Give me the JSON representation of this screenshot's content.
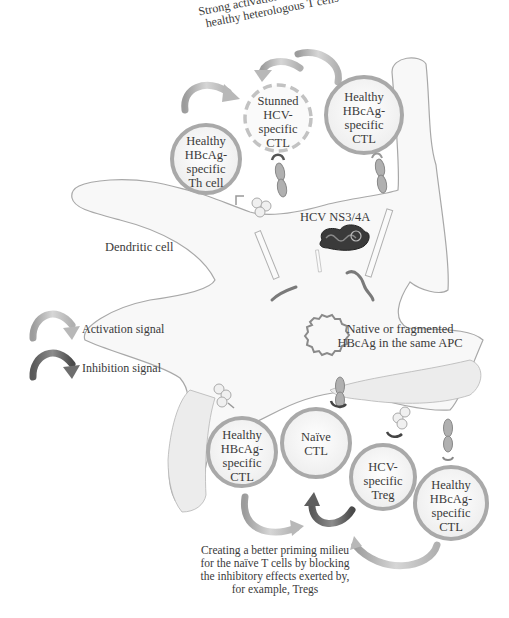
{
  "figure": {
    "top_annotation": {
      "line1": "Strong activation signals from",
      "line2": "healthy heterologous T cells"
    },
    "dendritic_cell_label": "Dendritic cell",
    "antigen_label": "HCV NS3/4A",
    "hbcag_label": {
      "line1": "Native or fragmented",
      "line2": "HBcAg in the same APC"
    },
    "legend": {
      "items": [
        {
          "label": "Activation signal",
          "color": "#b8b8b8"
        },
        {
          "label": "Inhibition signal",
          "color": "#6e6e6e"
        }
      ]
    },
    "cells": [
      {
        "id": "th-cell-top",
        "lines": [
          "Healthy",
          "HBcAg-",
          "specific",
          "Th cell"
        ],
        "style": "solid"
      },
      {
        "id": "stunned-hcv-ctl",
        "lines": [
          "Stunned",
          "HCV-",
          "specific",
          "CTL"
        ],
        "style": "dashed"
      },
      {
        "id": "healthy-ctl-top",
        "lines": [
          "Healthy",
          "HBcAg-",
          "specific",
          "CTL"
        ],
        "style": "solid"
      },
      {
        "id": "healthy-ctl-bottom-left",
        "lines": [
          "Healthy",
          "HBcAg-",
          "specific",
          "CTL"
        ],
        "style": "solid"
      },
      {
        "id": "naive-ctl",
        "lines": [
          "Naïve",
          "CTL"
        ],
        "style": "solid"
      },
      {
        "id": "hcv-treg",
        "lines": [
          "HCV-",
          "specific",
          "Treg"
        ],
        "style": "solid"
      },
      {
        "id": "healthy-ctl-bottom-right",
        "lines": [
          "Healthy",
          "HBcAg-",
          "specific",
          "CTL"
        ],
        "style": "solid"
      }
    ],
    "bottom_annotation": {
      "line1": "Creating a better priming milieu",
      "line2": "for the naïve T cells by blocking",
      "line3": "the inhibitory effects exerted by,",
      "line4": "for example, Tregs"
    },
    "colors": {
      "cell_border": "#a9a9a9",
      "cell_fill": "#f4f4f4",
      "outline": "#a0a0a0",
      "activation_arrow": "#b8b8b8",
      "inhibition_arrow": "#6e6e6e",
      "antigen": "#3a3a3a"
    }
  }
}
